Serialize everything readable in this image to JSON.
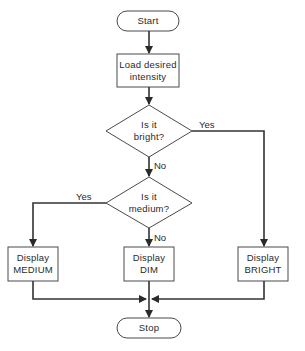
{
  "diagram": {
    "type": "flowchart",
    "nodes": {
      "start": {
        "kind": "terminal",
        "label": "Start"
      },
      "load": {
        "kind": "process",
        "lines": [
          "Load desired",
          "intensity"
        ]
      },
      "is_bright": {
        "kind": "decision",
        "lines": [
          "Is it",
          "bright?"
        ]
      },
      "is_medium": {
        "kind": "decision",
        "lines": [
          "Is it",
          "medium?"
        ]
      },
      "display_medium": {
        "kind": "process",
        "lines": [
          "Display",
          "MEDIUM"
        ]
      },
      "display_dim": {
        "kind": "process",
        "lines": [
          "Display",
          "DIM"
        ]
      },
      "display_bright": {
        "kind": "process",
        "lines": [
          "Display",
          "BRIGHT"
        ]
      },
      "stop": {
        "kind": "terminal",
        "label": "Stop"
      }
    },
    "edges": [
      {
        "from": "start",
        "to": "load",
        "label": ""
      },
      {
        "from": "load",
        "to": "is_bright",
        "label": ""
      },
      {
        "from": "is_bright",
        "to": "display_bright",
        "label": "Yes"
      },
      {
        "from": "is_bright",
        "to": "is_medium",
        "label": "No"
      },
      {
        "from": "is_medium",
        "to": "display_medium",
        "label": "Yes"
      },
      {
        "from": "is_medium",
        "to": "display_dim",
        "label": "No"
      },
      {
        "from": "display_medium",
        "to": "stop",
        "label": ""
      },
      {
        "from": "display_dim",
        "to": "stop",
        "label": ""
      },
      {
        "from": "display_bright",
        "to": "stop",
        "label": ""
      }
    ],
    "branch_labels": {
      "bright_yes": "Yes",
      "bright_no": "No",
      "medium_yes": "Yes",
      "medium_no": "No"
    },
    "colors": {
      "stroke": "#4a4a4a",
      "connector": "#333333",
      "text": "#2a2a2a",
      "background": "#ffffff"
    }
  }
}
